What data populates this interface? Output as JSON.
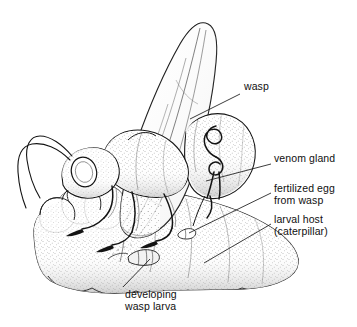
{
  "figure": {
    "style": "black-and-white stipple line drawing",
    "background_color": "#ffffff",
    "ink_color": "#1a1a1a",
    "width": 357,
    "height": 327
  },
  "labels": {
    "wasp": {
      "text": "wasp",
      "x": 244,
      "y": 86,
      "leader": "from (240,94) to (190,119)"
    },
    "venom_gland": {
      "text": "venom gland",
      "x": 274,
      "y": 158,
      "leader": "from (270,165) to (206,181)"
    },
    "fertilized_egg": {
      "line1": "fertilized egg",
      "line2": "from wasp",
      "x": 274,
      "y": 187,
      "leader": "from (270,194) to (189,232)"
    },
    "larval_host": {
      "line1": "larval host",
      "line2": "(caterpillar)",
      "x": 274,
      "y": 218,
      "leader": "from (270,225) to (205,262)"
    },
    "developing_wasp_larva": {
      "line1": "developing",
      "line2": "wasp larva",
      "x": 125,
      "y": 288,
      "leader": "from (122,292) to (150,258)"
    }
  },
  "parts": {
    "wing": "forewing raised vertically, triangular, veined",
    "thorax": "stippled thorax with raised wing base",
    "head": "head with large compound eye and long filamentous antennae",
    "abdomen": "curved stippled abdomen containing coiled venom gland",
    "ovipositor": "ovipositor piercing caterpillar cuticle",
    "legs": "three pairs of slender legs gripping host",
    "host_body": "segmented stippled caterpillar body",
    "larva_capsule": "small capsule-shaped developing wasp larva inside host",
    "egg_capsule": "small elongated fertilized egg under host cuticle"
  }
}
